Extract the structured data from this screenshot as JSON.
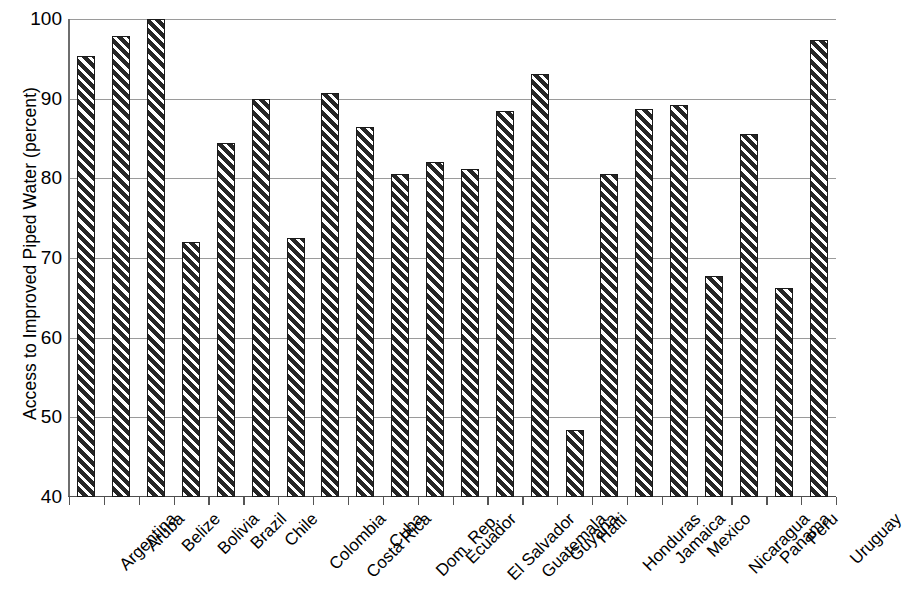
{
  "chart_data": {
    "type": "bar",
    "title": "",
    "xlabel": "",
    "ylabel": "Access to Improved Piped Water (percent)",
    "ylim": [
      40,
      100
    ],
    "yticks": [
      100,
      90,
      80,
      70,
      60,
      50,
      40
    ],
    "grid": true,
    "legend": "none",
    "bar_style": {
      "fill": "diagonal-hatch",
      "fill_color": "#262626",
      "hatch_color": "#ffffff",
      "edge_color": "#1a1a1a"
    },
    "categories": [
      "Argentina",
      "Aruba",
      "Belize",
      "Bolivia",
      "Brazil",
      "Chile",
      "Colombia",
      "Costa Rica",
      "Cuba",
      "Dom. Rep.",
      "Ecuador",
      "El Salvador",
      "Guatemala",
      "Guyana",
      "Haiti",
      "Honduras",
      "Jamaica",
      "Mexico",
      "Nicaragua",
      "Panama",
      "Peru",
      "Uruguay"
    ],
    "values": [
      95.3,
      97.9,
      100.0,
      72.0,
      84.4,
      90.0,
      72.5,
      90.7,
      86.4,
      80.5,
      82.1,
      81.2,
      88.5,
      93.1,
      48.4,
      80.5,
      88.7,
      89.2,
      67.7,
      85.6,
      66.2,
      97.4
    ]
  }
}
